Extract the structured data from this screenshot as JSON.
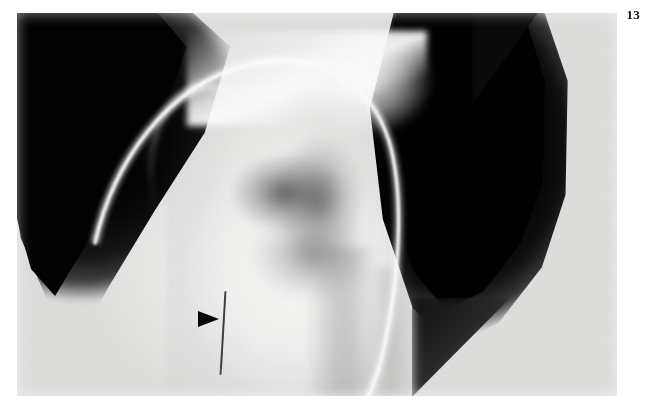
{
  "figure": {
    "number": "13",
    "caption_visible": false
  },
  "image": {
    "modality": "radiograph",
    "region": "chest",
    "view": "frontal",
    "description": "Chest radiograph showing a curved radiopaque catheter arcing over the mediastinum, with an arrowhead marker indicating a thin linear opacity",
    "background_color": "#ffffff",
    "plate_color": "#e9e9e8",
    "lung_field_color": "#000000"
  },
  "annotations": [
    {
      "name": "arrowhead-marker",
      "type": "arrowhead",
      "direction": "right",
      "color": "#070707",
      "x": 198,
      "y": 311
    }
  ],
  "findings": [
    {
      "name": "catheter-tube",
      "label": "radiopaque catheter",
      "appearance": "bright curved line",
      "color": "#fbfbfa"
    },
    {
      "name": "wire-density",
      "label": "linear opacity",
      "appearance": "thin dark line",
      "color": "#5a5a5a"
    },
    {
      "name": "lung-field-left",
      "label": "lucent lung field",
      "appearance": "dark radiolucent zone"
    },
    {
      "name": "lung-field-right",
      "label": "lucent lung field",
      "appearance": "dark radiolucent zone"
    },
    {
      "name": "mediastinum",
      "label": "central opacity",
      "appearance": "dense white soft tissue"
    }
  ]
}
